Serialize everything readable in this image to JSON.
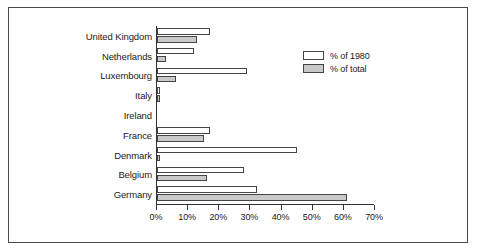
{
  "chart_data": {
    "type": "bar",
    "orientation": "horizontal",
    "title": "",
    "subtitle": "",
    "xlabel": "",
    "ylabel": "",
    "xlim": [
      0,
      70
    ],
    "xticks": [
      0,
      10,
      20,
      30,
      40,
      50,
      60,
      70
    ],
    "xtick_labels": [
      "0%",
      "10%",
      "20%",
      "30%",
      "40%",
      "50%",
      "60%",
      "70%"
    ],
    "grid": false,
    "legend_position": "upper-right-inside",
    "categories": [
      "United Kingdom",
      "Netherlands",
      "Luxembourg",
      "Italy",
      "Ireland",
      "France",
      "Denmark",
      "Belgium",
      "Germany"
    ],
    "series": [
      {
        "name": "% of 1980",
        "color": "#ffffff",
        "values": [
          17,
          12,
          29,
          1,
          0,
          17,
          45,
          28,
          32
        ]
      },
      {
        "name": "% of total",
        "color": "#c9c9c9",
        "values": [
          13,
          3,
          6,
          1,
          0,
          15,
          1,
          16,
          61
        ]
      }
    ]
  },
  "legend": {
    "items": [
      {
        "label": "% of 1980",
        "swatch": "white"
      },
      {
        "label": "% of total",
        "swatch": "gray"
      }
    ]
  },
  "colors": {
    "bar_white": "#ffffff",
    "bar_gray": "#c9c9c9",
    "bar_outline": "#444444",
    "axis": "#333333",
    "frame": "#4a4a4a",
    "text": "#1a1a1a",
    "background": "#ffffff"
  }
}
